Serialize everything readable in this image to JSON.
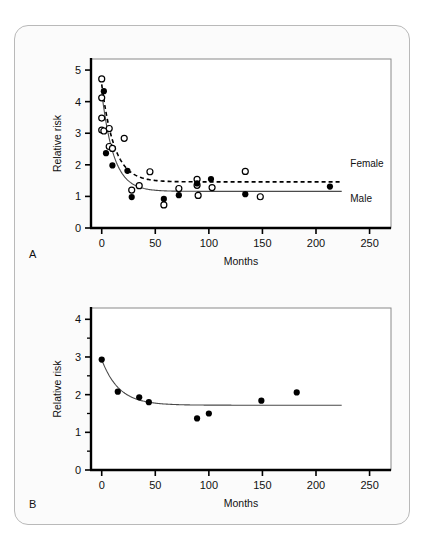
{
  "figure": {
    "panels": [
      {
        "label": "A"
      },
      {
        "label": "B"
      }
    ]
  },
  "chart_data": [
    {
      "type": "scatter",
      "panel": "A",
      "title": "",
      "xlabel": "Months",
      "ylabel": "Relative risk",
      "xlim": [
        -10,
        270
      ],
      "ylim": [
        0,
        5.35
      ],
      "xticks": [
        0,
        50,
        100,
        150,
        200,
        250
      ],
      "xticklabels": [
        "0",
        "50",
        "100",
        "150",
        "200",
        "250"
      ],
      "yticks": [
        0,
        1,
        2,
        3,
        4,
        5
      ],
      "yticklabels": [
        "0",
        "1",
        "2",
        "3",
        "4",
        "5"
      ],
      "grid": false,
      "legend_position": "right-inside",
      "series": [
        {
          "name": "Female",
          "marker": "open-circle",
          "line": "dashed",
          "points": [
            {
              "x": 0,
              "y": 4.72
            },
            {
              "x": 0,
              "y": 4.12
            },
            {
              "x": 0,
              "y": 3.48
            },
            {
              "x": 0,
              "y": 3.1
            },
            {
              "x": 2,
              "y": 3.07
            },
            {
              "x": 7,
              "y": 3.15
            },
            {
              "x": 7,
              "y": 2.58
            },
            {
              "x": 10,
              "y": 2.52
            },
            {
              "x": 21,
              "y": 2.84
            },
            {
              "x": 28,
              "y": 1.2
            },
            {
              "x": 35,
              "y": 1.34
            },
            {
              "x": 45,
              "y": 1.78
            },
            {
              "x": 58,
              "y": 0.73
            },
            {
              "x": 72,
              "y": 1.25
            },
            {
              "x": 89,
              "y": 1.54
            },
            {
              "x": 89,
              "y": 1.35
            },
            {
              "x": 90,
              "y": 1.03
            },
            {
              "x": 103,
              "y": 1.28
            },
            {
              "x": 134,
              "y": 1.79
            },
            {
              "x": 148,
              "y": 0.99
            }
          ]
        },
        {
          "name": "Male",
          "marker": "filled-circle",
          "line": "solid",
          "points": [
            {
              "x": 2,
              "y": 4.33
            },
            {
              "x": 4,
              "y": 2.37
            },
            {
              "x": 10,
              "y": 1.98
            },
            {
              "x": 24,
              "y": 1.81
            },
            {
              "x": 28,
              "y": 0.98
            },
            {
              "x": 58,
              "y": 0.92
            },
            {
              "x": 72,
              "y": 1.04
            },
            {
              "x": 89,
              "y": 1.41
            },
            {
              "x": 102,
              "y": 1.55
            },
            {
              "x": 134,
              "y": 1.07
            },
            {
              "x": 213,
              "y": 1.31
            }
          ]
        }
      ],
      "fit_curves": [
        {
          "name": "Female",
          "style": "dashed",
          "asymptote": 1.46,
          "start_y": 4.55,
          "decay_rate": 0.085,
          "x_start": 0,
          "x_end": 224
        },
        {
          "name": "Male",
          "style": "solid",
          "asymptote": 1.16,
          "start_y": 4.3,
          "decay_rate": 0.09,
          "x_start": 0,
          "x_end": 224
        }
      ],
      "annotations": [
        {
          "text": "Female",
          "x": 232,
          "y": 1.92
        },
        {
          "text": "Male",
          "x": 232,
          "y": 0.82
        }
      ]
    },
    {
      "type": "scatter",
      "panel": "B",
      "title": "",
      "xlabel": "Months",
      "ylabel": "Relative risk",
      "xlim": [
        -10,
        270
      ],
      "ylim": [
        0,
        4.3
      ],
      "xticks": [
        0,
        50,
        100,
        150,
        200,
        250
      ],
      "xticklabels": [
        "0",
        "50",
        "100",
        "150",
        "200",
        "250"
      ],
      "yticks": [
        0,
        1,
        2,
        3,
        4
      ],
      "yticklabels": [
        "0",
        "1",
        "2",
        "3",
        "4"
      ],
      "yminorticks": [
        0.5,
        1.5,
        2.5,
        3.5
      ],
      "grid": false,
      "legend_position": "none",
      "series": [
        {
          "name": "Overall",
          "marker": "filled-circle",
          "line": "solid",
          "points": [
            {
              "x": 0,
              "y": 2.93
            },
            {
              "x": 15,
              "y": 2.08
            },
            {
              "x": 35,
              "y": 1.93
            },
            {
              "x": 44,
              "y": 1.8
            },
            {
              "x": 89,
              "y": 1.37
            },
            {
              "x": 100,
              "y": 1.5
            },
            {
              "x": 149,
              "y": 1.84
            },
            {
              "x": 182,
              "y": 2.06
            }
          ]
        }
      ],
      "fit_curves": [
        {
          "name": "Overall",
          "style": "solid",
          "asymptote": 1.72,
          "start_y": 2.93,
          "decay_rate": 0.062,
          "x_start": 0,
          "x_end": 224
        }
      ],
      "annotations": []
    }
  ]
}
